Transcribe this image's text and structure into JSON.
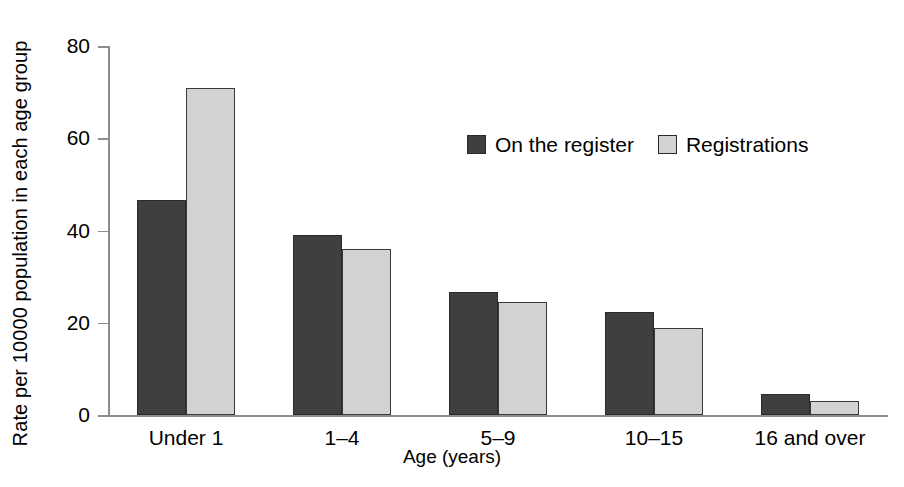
{
  "chart_data": {
    "type": "bar",
    "title": "",
    "xlabel": "Age (years)",
    "ylabel": "Rate per 10000 population in each age group",
    "categories": [
      "Under 1",
      "1–4",
      "5–9",
      "10–15",
      "16 and over"
    ],
    "series": [
      {
        "name": "On the register",
        "color": "#3f3f3f",
        "values": [
          46.7,
          39.0,
          26.7,
          22.3,
          4.5
        ]
      },
      {
        "name": "Registrations",
        "color": "#d2d2d2",
        "values": [
          71.0,
          36.0,
          24.4,
          18.9,
          3.1
        ]
      }
    ],
    "ylim": [
      0,
      80
    ],
    "yticks": [
      0,
      20,
      40,
      60,
      80
    ],
    "ytick_labels": [
      "0",
      "20",
      "40",
      "60",
      "80"
    ],
    "grid": false,
    "legend_position": "upper center"
  },
  "legend": {
    "items": [
      {
        "label": "On the register",
        "swatch": "dark"
      },
      {
        "label": "Registrations",
        "swatch": "light"
      }
    ]
  },
  "axes": {
    "y_title": "Rate per 10000 population in each age group",
    "x_title": "Age (years)"
  }
}
